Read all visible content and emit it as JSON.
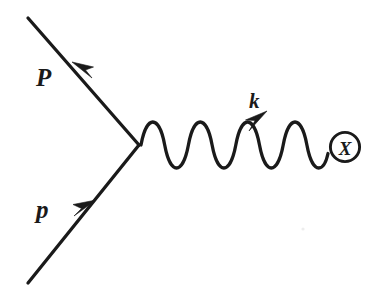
{
  "figure": {
    "kind": "feynman-diagram",
    "title": "Feynman diagram: electron-proton scattering with exchanged photon absorbed by target X",
    "background_color": "#ffffff",
    "ink_color": "#1a1a1a",
    "width": 371,
    "height": 299
  },
  "labels": {
    "outgoing_momentum": "P",
    "incoming_momentum": "p",
    "photon_momentum": "k",
    "blob_marker": "X"
  },
  "geometry": {
    "vertex": {
      "x": 139,
      "y": 145
    },
    "outgoing_line": {
      "x1": 139,
      "y1": 145,
      "x2": 28,
      "y2": 18
    },
    "incoming_line": {
      "x1": 28,
      "y1": 283,
      "x2": 139,
      "y2": 145
    },
    "photon_line": {
      "x_start": 141,
      "x_end": 327,
      "y_center": 141,
      "amplitude": 19,
      "wavelength": 23.5,
      "cycles": 8
    },
    "blob_circle": {
      "cx": 345,
      "cy": 147,
      "r": 15
    },
    "stroke_width": 3.2
  },
  "arrowheads": {
    "outgoing_arrow": {
      "tip_x": 72,
      "tip_y": 62,
      "direction": "up-left",
      "along": "outgoing-fermion-line"
    },
    "incoming_arrow": {
      "tip_x": 96,
      "tip_y": 200,
      "direction": "up-right",
      "along": "incoming-fermion-line"
    },
    "photon_arrow": {
      "tip_x": 267,
      "tip_y": 111,
      "direction": "up-right",
      "along": "photon-line"
    }
  },
  "label_positions": {
    "outgoing_momentum": {
      "x": 36,
      "y": 86,
      "font_size": 25
    },
    "incoming_momentum": {
      "x": 36,
      "y": 218,
      "font_size": 25
    },
    "photon_momentum": {
      "x": 249,
      "y": 108,
      "font_size": 21
    },
    "blob_marker": {
      "x": 345,
      "y": 155,
      "font_size": 19
    }
  },
  "artifacts": {
    "scan_speck": {
      "cx": 303,
      "cy": 229,
      "r": 1.6
    }
  }
}
